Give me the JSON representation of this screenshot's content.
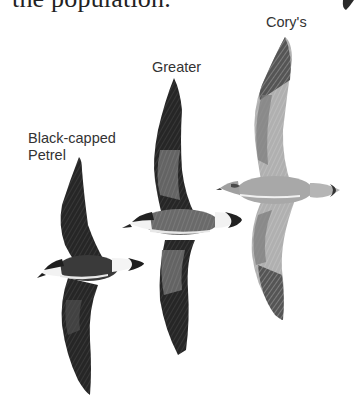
{
  "page": {
    "body_text_fragment": "the population.",
    "labels": {
      "cory": "Cory's",
      "greater": "Greater",
      "black_capped_line1": "Black-capped",
      "black_capped_line2": "Petrel"
    },
    "birds": [
      {
        "name": "Black-capped Petrel",
        "tone": "dark",
        "color": "#2b2b2b"
      },
      {
        "name": "Greater Shearwater",
        "tone": "medium-dark",
        "color": "#3a3a3a"
      },
      {
        "name": "Cory's Shearwater",
        "tone": "light",
        "color": "#9a9a9a"
      }
    ],
    "colors": {
      "background": "#ffffff",
      "text": "#333333",
      "dark_plumage": "#262626",
      "mid_plumage": "#6e6e6e",
      "light_plumage": "#b4b4b4",
      "white_patch": "#f2f2f2"
    }
  }
}
